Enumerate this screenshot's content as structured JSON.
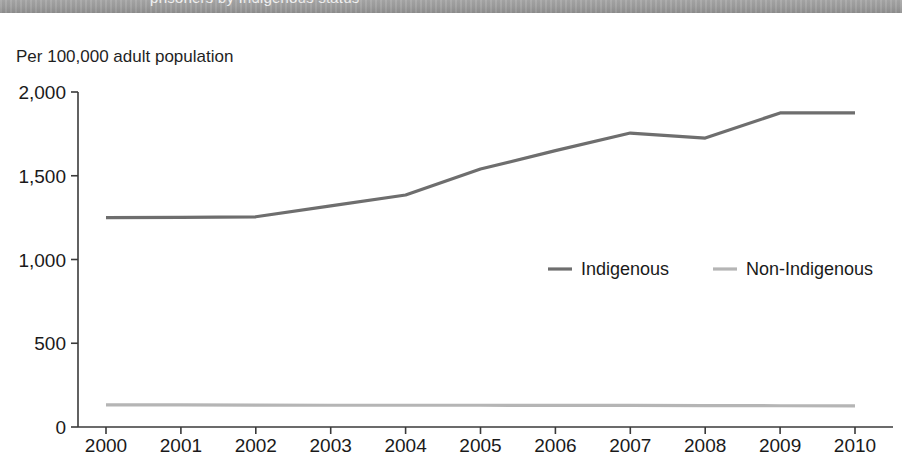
{
  "header": {
    "band_text": "prisoners by Indigenous status"
  },
  "axis_unit": "Per 100,000 adult population",
  "chart_data": {
    "type": "line",
    "title": "",
    "subtitle": "",
    "xlabel": "",
    "ylabel": "Per 100,000 adult population",
    "x": [
      2000,
      2001,
      2002,
      2003,
      2004,
      2005,
      2006,
      2007,
      2008,
      2009,
      2010
    ],
    "categories": [
      "2000",
      "2001",
      "2002",
      "2003",
      "2004",
      "2005",
      "2006",
      "2007",
      "2008",
      "2009",
      "2010"
    ],
    "series": [
      {
        "name": "Indigenous",
        "color": "#6e6e6e",
        "values": [
          1250,
          1252,
          1255,
          1320,
          1385,
          1540,
          1650,
          1755,
          1725,
          1875,
          1875
        ]
      },
      {
        "name": "Non-Indigenous",
        "color": "#b5b5b5",
        "values": [
          132,
          132,
          131,
          130,
          130,
          130,
          129,
          129,
          128,
          127,
          126
        ]
      }
    ],
    "ylim": [
      0,
      2000
    ],
    "yticks": [
      0,
      500,
      1000,
      1500,
      2000
    ],
    "ytick_labels": [
      "0",
      "500",
      "1,000",
      "1,500",
      "2,000"
    ],
    "xlim": [
      2000,
      2010
    ],
    "grid": false,
    "legend_position": "inside-right-middle",
    "legend": [
      "Indigenous",
      "Non-Indigenous"
    ]
  },
  "colors": {
    "indigenous": "#6e6e6e",
    "non_indigenous": "#b5b5b5",
    "axis": "#3a3a3a",
    "header_band": "#9d9d9d"
  }
}
